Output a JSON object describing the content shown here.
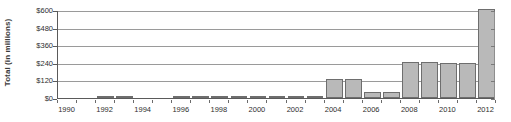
{
  "chart_data": {
    "type": "bar",
    "title": "",
    "subtitle": "",
    "xlabel": "",
    "ylabel": "Total (in millions)",
    "grid": true,
    "legend": false,
    "legend_position": "none",
    "ylim": [
      0,
      600
    ],
    "ytick_labels": [
      "$0",
      "$120",
      "$240",
      "$360",
      "$480",
      "$600"
    ],
    "ytick_values": [
      0,
      120,
      240,
      360,
      480,
      600
    ],
    "xtick_labels": [
      "1990",
      "1992",
      "1994",
      "1996",
      "1998",
      "2000",
      "2002",
      "2004",
      "2006",
      "2008",
      "2010",
      "2012"
    ],
    "categories": [
      "1990",
      "1991",
      "1992",
      "1993",
      "1994",
      "1995",
      "1996",
      "1997",
      "1998",
      "1999",
      "2000",
      "2001",
      "2002",
      "2003",
      "2004",
      "2005",
      "2006",
      "2007",
      "2008",
      "2009",
      "2010",
      "2011",
      "2012"
    ],
    "values": [
      0,
      0,
      8,
      8,
      0,
      0,
      8,
      8,
      8,
      8,
      12,
      12,
      12,
      12,
      130,
      130,
      40,
      40,
      245,
      245,
      240,
      240,
      605
    ],
    "bar_fill_color": "#b9b9b9",
    "bar_border_color": "#6e6e6e",
    "gridline_color": "#9a9a9a",
    "axis_color": "#5a5a5a",
    "text_color": "#2e2e2e",
    "background_color": "#ffffff"
  }
}
